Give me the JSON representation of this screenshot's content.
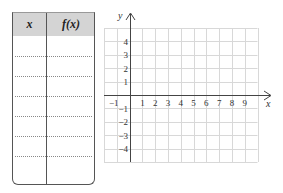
{
  "table": {
    "headers": [
      "x",
      "f(x)"
    ],
    "rows": [
      {
        "x": "",
        "fx": ""
      },
      {
        "x": "",
        "fx": ""
      },
      {
        "x": "",
        "fx": ""
      },
      {
        "x": "",
        "fx": ""
      },
      {
        "x": "",
        "fx": ""
      },
      {
        "x": "",
        "fx": ""
      },
      {
        "x": "",
        "fx": ""
      }
    ]
  },
  "graph": {
    "x_axis_label": "x",
    "y_axis_label": "y",
    "x_ticks": [
      "−1",
      "1",
      "2",
      "3",
      "4",
      "5",
      "6",
      "7",
      "8",
      "9"
    ],
    "y_ticks_positive": [
      "4",
      "3",
      "2",
      "1"
    ],
    "y_ticks_negative": [
      "−1",
      "−2",
      "−3",
      "−4"
    ],
    "x_range": [
      -2,
      10
    ],
    "y_range": [
      -5,
      5
    ]
  },
  "colors": {
    "header_bg": "#d4d4d4",
    "grid": "#d8d8d8",
    "axis": "#444444"
  }
}
